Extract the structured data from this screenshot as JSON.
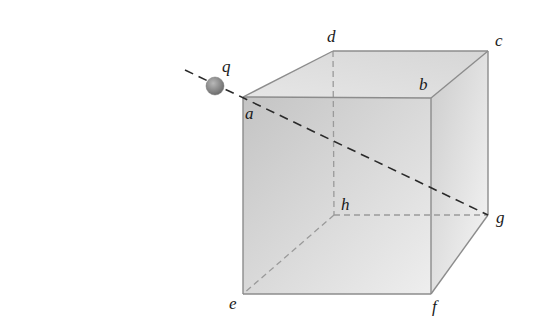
{
  "diagram": {
    "charge": {
      "label": "q",
      "cx": 215,
      "cy": 86,
      "r": 9,
      "color": "#8a8a8a"
    },
    "vertices": {
      "a": {
        "label": "a",
        "x": 243,
        "y": 97,
        "lx": 245,
        "ly": 118
      },
      "b": {
        "label": "b",
        "x": 431,
        "y": 98,
        "lx": 420,
        "ly": 88
      },
      "c": {
        "label": "c",
        "x": 488,
        "y": 51,
        "lx": 495,
        "ly": 45
      },
      "d": {
        "label": "d",
        "x": 333,
        "y": 51,
        "lx": 327,
        "ly": 42
      },
      "e": {
        "label": "e",
        "x": 243,
        "y": 294,
        "lx": 229,
        "ly": 308
      },
      "f": {
        "label": "f",
        "x": 431,
        "y": 294,
        "lx": 432,
        "ly": 312
      },
      "g": {
        "label": "g",
        "x": 488,
        "y": 215,
        "lx": 495,
        "ly": 223
      },
      "h": {
        "label": "h",
        "x": 334,
        "y": 215,
        "lx": 340,
        "ly": 210
      }
    },
    "colors": {
      "edge": "#8c8c8c",
      "hidden_edge": "#9a9a9a",
      "diagonal": "#2a2a2a",
      "front_face_dark": "#c4c4c4",
      "front_face_light": "#ededed",
      "top_face": "#dedede",
      "right_face_dark": "#cfcfcf",
      "right_face_light": "#f4f4f4"
    }
  }
}
